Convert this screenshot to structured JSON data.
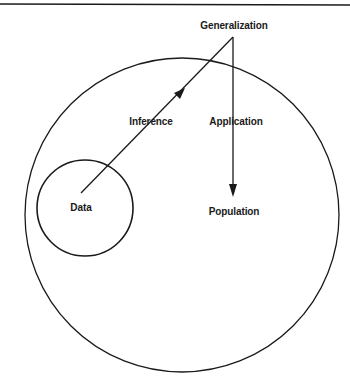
{
  "diagram": {
    "labels": {
      "generalization": "Generalization",
      "inference": "Inference",
      "application": "Application",
      "data": "Data",
      "population": "Population"
    },
    "nodes": [
      {
        "id": "population",
        "shape": "circle",
        "label": "Population"
      },
      {
        "id": "data",
        "shape": "circle",
        "label": "Data",
        "inside": "population"
      },
      {
        "id": "generalization",
        "shape": "point",
        "label": "Generalization"
      }
    ],
    "edges": [
      {
        "from": "data",
        "to": "generalization",
        "label": "Inference",
        "arrow": true
      },
      {
        "from": "generalization",
        "to": "population",
        "label": "Application",
        "arrow": true
      }
    ],
    "colors": {
      "stroke": "#1a1a1a",
      "background": "#ffffff"
    }
  }
}
